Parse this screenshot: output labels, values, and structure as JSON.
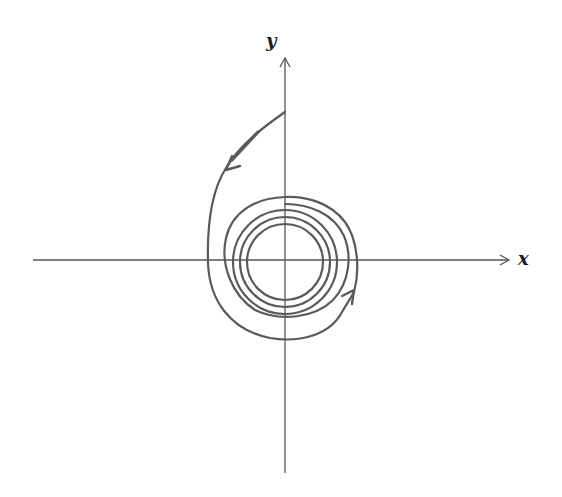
{
  "diagram": {
    "type": "phase-portrait",
    "axes": {
      "x_label": "x",
      "y_label": "y",
      "origin": [
        285,
        260
      ]
    },
    "colors": {
      "axis": "#555555",
      "trajectory": "#5a5a5a",
      "label": "#1a1a1a"
    },
    "trajectory": {
      "start_point": "on positive y-axis",
      "direction": "counterclockwise",
      "arrows": [
        "upper-left, pointing down-left",
        "lower-right, pointing up-right"
      ],
      "rings_visible": 5
    }
  }
}
